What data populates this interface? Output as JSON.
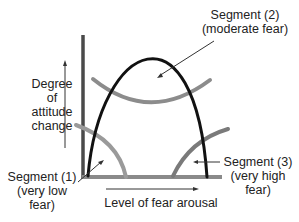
{
  "diagram": {
    "type": "fear-appeal curve diagram",
    "y_axis_label": [
      "Degree",
      "of",
      "attitude",
      "change"
    ],
    "x_axis_label": "Level of fear arousal",
    "annotations": {
      "segment2": [
        "Segment (2)",
        "(moderate fear)"
      ],
      "segment1": [
        "Segment (1)",
        "(very low",
        "fear)"
      ],
      "segment3": [
        "Segment (3)",
        "(very high",
        "fear)"
      ]
    },
    "colors": {
      "main_curve": "#111111",
      "segment_curves": "#8c8c8c",
      "axes": "#555555",
      "text": "#222222"
    }
  }
}
